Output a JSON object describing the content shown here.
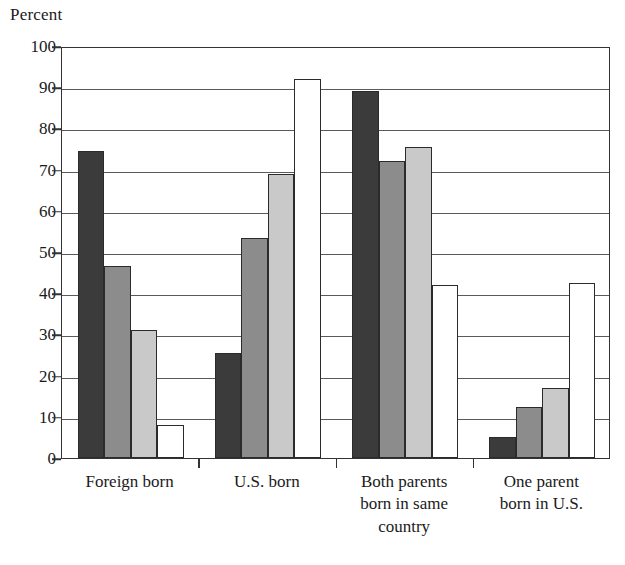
{
  "chart_data": {
    "type": "bar",
    "title": "",
    "ylabel": "Percent",
    "xlabel": "",
    "ylim": [
      0,
      100
    ],
    "ytick_step": 10,
    "grid": true,
    "legend": "none",
    "categories": [
      "Foreign born",
      "U.S. born",
      "Both parents born in same country",
      "One parent born in U.S."
    ],
    "category_lines": [
      [
        "Foreign born"
      ],
      [
        "U.S. born"
      ],
      [
        "Both parents",
        "born in same",
        "country"
      ],
      [
        "One parent",
        "born in U.S."
      ]
    ],
    "ytick_labels": [
      "100",
      "90",
      "80",
      "70",
      "60",
      "50",
      "40",
      "30",
      "20",
      "10",
      "0"
    ],
    "series": [
      {
        "name": "series-1",
        "color": "#3b3b3b",
        "values": [
          74.5,
          25.5,
          89.0,
          5.0
        ]
      },
      {
        "name": "series-2",
        "color": "#8c8c8c",
        "values": [
          46.5,
          53.5,
          72.0,
          12.5
        ]
      },
      {
        "name": "series-3",
        "color": "#c9c9c9",
        "values": [
          31.0,
          69.0,
          75.5,
          17.0
        ]
      },
      {
        "name": "series-4",
        "color": "#ffffff",
        "values": [
          8.0,
          92.0,
          42.0,
          42.5
        ]
      }
    ]
  }
}
